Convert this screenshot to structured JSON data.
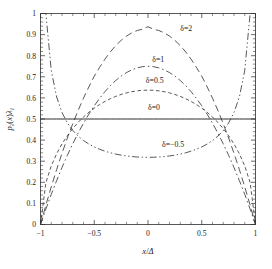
{
  "chart_data": {
    "type": "line",
    "title": "",
    "subtitle": "",
    "xlabel": "x/Δ",
    "ylabel": "pλ(x)λ₁",
    "xlim": [
      -1,
      1
    ],
    "ylim": [
      0,
      1
    ],
    "grid": false,
    "legend_position": "inline-annotations",
    "x_ticks": [
      -1,
      -0.5,
      0,
      0.5,
      1
    ],
    "x_tick_labels": [
      "−1",
      "−0.5",
      "0",
      "0.5",
      "1"
    ],
    "x_minor_tick_count_per_interval": 4,
    "y_ticks": [
      0,
      0.1,
      0.2,
      0.3,
      0.4,
      0.5,
      0.6,
      0.7,
      0.8,
      0.9,
      1
    ],
    "y_tick_labels": [
      "0",
      "0.1",
      "0.2",
      "0.3",
      "0.4",
      "0.5",
      "0.6",
      "0.7",
      "0.8",
      "0.9",
      "1"
    ],
    "y_minor_tick_count_per_interval": 4,
    "x": [
      -1,
      -0.95,
      -0.9,
      -0.85,
      -0.8,
      -0.75,
      -0.7,
      -0.65,
      -0.6,
      -0.55,
      -0.5,
      -0.45,
      -0.4,
      -0.35,
      -0.3,
      -0.25,
      -0.2,
      -0.15,
      -0.1,
      -0.05,
      0,
      0.05,
      0.1,
      0.15,
      0.2,
      0.25,
      0.3,
      0.35,
      0.4,
      0.45,
      0.5,
      0.55,
      0.6,
      0.65,
      0.7,
      0.75,
      0.8,
      0.85,
      0.9,
      0.95,
      1
    ],
    "series": [
      {
        "name": "δ=2",
        "label": "δ=2",
        "linestyle": "long-dash",
        "peak_value": 0.938,
        "peak_x": 0,
        "endpoint_values": [
          0,
          0
        ],
        "values": [
          0.0,
          0.0915,
          0.1782,
          0.2603,
          0.3375,
          0.4099,
          0.4777,
          0.5406,
          0.5988,
          0.6523,
          0.7031,
          0.745,
          0.784,
          0.8183,
          0.8479,
          0.8727,
          0.893,
          0.9086,
          0.9195,
          0.9258,
          0.9375,
          0.9258,
          0.9195,
          0.9086,
          0.893,
          0.8727,
          0.8479,
          0.8183,
          0.784,
          0.745,
          0.7031,
          0.6523,
          0.5988,
          0.5406,
          0.4777,
          0.4099,
          0.3375,
          0.2603,
          0.1782,
          0.0915,
          0.0
        ]
      },
      {
        "name": "δ=1",
        "label": "δ=1",
        "linestyle": "dash-dot",
        "peak_value": 0.75,
        "peak_x": 0,
        "endpoint_values": [
          0,
          0
        ],
        "values": [
          0.0,
          0.0731,
          0.1425,
          0.2081,
          0.27,
          0.3281,
          0.3825,
          0.4331,
          0.48,
          0.5231,
          0.5625,
          0.5981,
          0.63,
          0.6581,
          0.6825,
          0.7031,
          0.72,
          0.7331,
          0.7425,
          0.7481,
          0.75,
          0.7481,
          0.7425,
          0.7331,
          0.72,
          0.7031,
          0.6825,
          0.6581,
          0.63,
          0.5981,
          0.5625,
          0.5231,
          0.48,
          0.4331,
          0.3825,
          0.3281,
          0.27,
          0.2081,
          0.1425,
          0.0731,
          0.0
        ]
      },
      {
        "name": "δ=0.5",
        "label": "δ=0.5",
        "linestyle": "short-dash",
        "peak_value": 0.637,
        "peak_x": 0,
        "endpoint_values": [
          0,
          0
        ],
        "values": [
          0.0,
          0.1987,
          0.2775,
          0.3354,
          0.382,
          0.4209,
          0.4546,
          0.4838,
          0.5093,
          0.532,
          0.5513,
          0.5686,
          0.5834,
          0.5962,
          0.6073,
          0.6164,
          0.6238,
          0.6296,
          0.6334,
          0.6362,
          0.6366,
          0.6362,
          0.6334,
          0.6296,
          0.6238,
          0.6164,
          0.6073,
          0.5962,
          0.5834,
          0.5686,
          0.5513,
          0.532,
          0.5093,
          0.4838,
          0.4546,
          0.4209,
          0.382,
          0.3354,
          0.2775,
          0.1987,
          0.0
        ]
      },
      {
        "name": "δ=0",
        "label": "δ=0",
        "linestyle": "solid",
        "peak_value": 0.5,
        "peak_x": 0,
        "endpoint_values": [
          0.5,
          0.5
        ],
        "values": [
          0.5,
          0.5,
          0.5,
          0.5,
          0.5,
          0.5,
          0.5,
          0.5,
          0.5,
          0.5,
          0.5,
          0.5,
          0.5,
          0.5,
          0.5,
          0.5,
          0.5,
          0.5,
          0.5,
          0.5,
          0.5,
          0.5,
          0.5,
          0.5,
          0.5,
          0.5,
          0.5,
          0.5,
          0.5,
          0.5,
          0.5,
          0.5,
          0.5,
          0.5,
          0.5,
          0.5,
          0.5,
          0.5,
          0.5,
          0.5,
          0.5
        ]
      },
      {
        "name": "δ=−0.5",
        "label": "δ=−0.5",
        "linestyle": "dash-dot-dot",
        "min_value": 0.318,
        "min_x": 0,
        "endpoint_values": [
          1.0,
          1.0
        ],
        "values": [
          1.02,
          1.0195,
          0.7304,
          0.6043,
          0.5308,
          0.4813,
          0.4457,
          0.4188,
          0.3979,
          0.3813,
          0.3676,
          0.3566,
          0.3474,
          0.3398,
          0.3336,
          0.3287,
          0.3248,
          0.3219,
          0.3199,
          0.3187,
          0.3183,
          0.3187,
          0.3199,
          0.3219,
          0.3248,
          0.3287,
          0.3336,
          0.3398,
          0.3474,
          0.3566,
          0.3676,
          0.3813,
          0.3979,
          0.4188,
          0.4457,
          0.4813,
          0.5308,
          0.6043,
          0.7304,
          1.0195,
          1.02
        ]
      }
    ],
    "annotations": [
      {
        "text": "δ=2",
        "x": 0.3,
        "y": 0.915
      },
      {
        "text": "δ=1",
        "x": 0.04,
        "y": 0.772
      },
      {
        "text": "δ=0.5",
        "x": -0.02,
        "y": 0.672
      },
      {
        "text": "δ=0",
        "x": 0.0,
        "y": 0.545
      },
      {
        "text": "δ=−0.5",
        "x": 0.13,
        "y": 0.365
      }
    ],
    "colors": {
      "axis": "#2b2b2b",
      "curve": "#3a3a3a",
      "curve_solid": "#222222",
      "background": "#ffffff",
      "text": "#1a1a1a"
    }
  },
  "axes": {
    "x_title": "x/Δ",
    "y_title": "pλ(x)λ₁",
    "y_title_parts": {
      "p": "p",
      "sub1": "λ",
      "open": "(",
      "var": "x",
      "close": ")",
      "sub2": "λ",
      "sub3": "1"
    },
    "x_title_parts": {
      "var": "x",
      "slash": "/",
      "denom": "Δ"
    }
  }
}
